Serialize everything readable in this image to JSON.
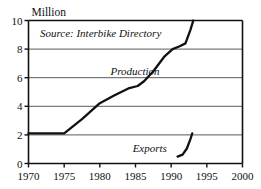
{
  "chart_data": {
    "type": "line",
    "title": "",
    "unit_label": "Million",
    "xlabel": "",
    "ylabel": "",
    "xlim": [
      1970,
      2000
    ],
    "ylim": [
      0,
      10
    ],
    "grid": true,
    "grid_axis": "y",
    "legend_position": "inline-annotation",
    "x_ticks": [
      1970,
      1975,
      1980,
      1985,
      1990,
      1995,
      2000
    ],
    "x_tick_labels": [
      "1970",
      "1975",
      "1980",
      "1985",
      "1990",
      "1995",
      "2000"
    ],
    "y_ticks": [
      0,
      2,
      4,
      6,
      8,
      10
    ],
    "y_tick_labels": [
      "0",
      "2",
      "4",
      "6",
      "8",
      "10"
    ],
    "annotations": [
      {
        "name": "source-note",
        "text": "Source: Interbike Directory",
        "x": 1971.6,
        "y": 9.15
      }
    ],
    "series": [
      {
        "name": "Production",
        "label": "Production",
        "label_x": 1981.5,
        "label_y": 6.45,
        "color": "#111111",
        "line_width": 2.3,
        "points": [
          {
            "x": 1970.0,
            "y": 2.1
          },
          {
            "x": 1975.0,
            "y": 2.1
          },
          {
            "x": 1977.5,
            "y": 3.1
          },
          {
            "x": 1980.0,
            "y": 4.22
          },
          {
            "x": 1982.0,
            "y": 4.75
          },
          {
            "x": 1984.0,
            "y": 5.25
          },
          {
            "x": 1985.3,
            "y": 5.42
          },
          {
            "x": 1986.2,
            "y": 5.75
          },
          {
            "x": 1987.5,
            "y": 6.45
          },
          {
            "x": 1989.0,
            "y": 7.45
          },
          {
            "x": 1990.2,
            "y": 8.0
          },
          {
            "x": 1991.2,
            "y": 8.2
          },
          {
            "x": 1992.0,
            "y": 8.4
          },
          {
            "x": 1992.7,
            "y": 9.35
          },
          {
            "x": 1993.1,
            "y": 10.0
          }
        ]
      },
      {
        "name": "Exports",
        "label": "Exports",
        "label_x": 1984.6,
        "label_y": 1.05,
        "color": "#111111",
        "line_width": 2.3,
        "points": [
          {
            "x": 1990.9,
            "y": 0.48
          },
          {
            "x": 1991.6,
            "y": 0.62
          },
          {
            "x": 1992.2,
            "y": 1.05
          },
          {
            "x": 1992.7,
            "y": 1.7
          },
          {
            "x": 1992.95,
            "y": 2.1
          }
        ]
      }
    ],
    "colors": {
      "line": "#111111",
      "gridline": "#5a5a5a",
      "axis": "#111111",
      "background": "#ffffff",
      "text": "#111111"
    }
  }
}
